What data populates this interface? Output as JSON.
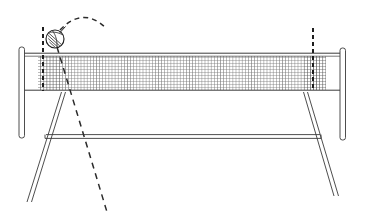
{
  "diagram": {
    "background_color": "#ffffff",
    "ink_color": "#2b2b2b",
    "net_mesh_color": "#6a6a6a",
    "canvas": {
      "width": 365,
      "height": 219
    }
  },
  "elements": {
    "left_post": {
      "label": "left net post",
      "x": 20,
      "y_top": 47,
      "y_bottom": 138,
      "width": 6
    },
    "right_post": {
      "label": "right net post",
      "x": 340,
      "y_top": 48,
      "y_bottom": 140,
      "width": 6
    },
    "net": {
      "label": "net mesh panel",
      "x": 38,
      "y": 53,
      "width": 300,
      "height": 37,
      "mesh_spacing": 3
    },
    "net_top_band": {
      "label": "net top tape band",
      "y": 53,
      "height": 3
    },
    "net_bottom_band": {
      "label": "net bottom cord",
      "y": 90,
      "height": 1
    },
    "left_antenna": {
      "label": "left antenna (dashed)",
      "x": 43,
      "y_top": 27,
      "y_bottom": 91,
      "dash": "4 3"
    },
    "right_antenna": {
      "label": "right antenna (dashed)",
      "x": 313,
      "y_top": 28,
      "y_bottom": 91,
      "dash": "4 3"
    },
    "ball": {
      "label": "volleyball",
      "cx": 55,
      "cy": 39,
      "r": 9,
      "seam_count": 5
    },
    "trajectory_arc": {
      "label": "ball flight path (dashed arc)",
      "start": [
        60,
        30
      ],
      "control": [
        83,
        6
      ],
      "end": [
        106,
        28
      ],
      "dash": "5 4"
    },
    "trajectory_descent": {
      "label": "ball descent path (dashed straight line)",
      "start": [
        57,
        47
      ],
      "end": [
        107,
        212
      ],
      "dash": "6 5"
    },
    "left_leg": {
      "label": "left support leg",
      "top": [
        61,
        92
      ],
      "bottom": [
        27,
        202
      ],
      "thickness": 4
    },
    "right_leg": {
      "label": "right support leg",
      "top": [
        307,
        92
      ],
      "bottom": [
        338,
        196
      ],
      "thickness": 4
    },
    "crossbar": {
      "label": "horizontal crossbar",
      "x1": 45,
      "x2": 320,
      "y": 136,
      "thickness": 3
    }
  },
  "annotations": {
    "figure_caption": "",
    "notes": []
  }
}
